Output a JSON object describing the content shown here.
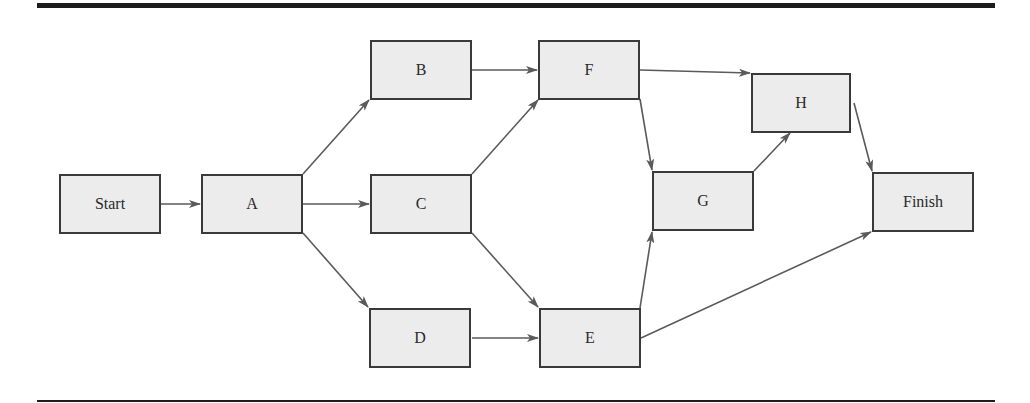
{
  "diagram": {
    "type": "activity-on-node network",
    "colors": {
      "node_fill": "#ececec",
      "node_border": "#3a3a3a",
      "edge": "#5a5a5a",
      "rule": "#1c1c1c"
    },
    "nodes": [
      {
        "id": "start",
        "label": "Start",
        "x": 59,
        "y": 174
      },
      {
        "id": "A",
        "label": "A",
        "x": 201,
        "y": 174
      },
      {
        "id": "B",
        "label": "B",
        "x": 370,
        "y": 40
      },
      {
        "id": "C",
        "label": "C",
        "x": 370,
        "y": 174
      },
      {
        "id": "D",
        "label": "D",
        "x": 369,
        "y": 308
      },
      {
        "id": "F",
        "label": "F",
        "x": 538,
        "y": 40
      },
      {
        "id": "E",
        "label": "E",
        "x": 539,
        "y": 308
      },
      {
        "id": "G",
        "label": "G",
        "x": 652,
        "y": 171
      },
      {
        "id": "H",
        "label": "H",
        "x": 751,
        "y": 73
      },
      {
        "id": "finish",
        "label": "Finish",
        "x": 872,
        "y": 172
      }
    ],
    "edges": [
      [
        "Start",
        "A"
      ],
      [
        "A",
        "B"
      ],
      [
        "A",
        "C"
      ],
      [
        "A",
        "D"
      ],
      [
        "B",
        "F"
      ],
      [
        "C",
        "F"
      ],
      [
        "C",
        "E"
      ],
      [
        "D",
        "E"
      ],
      [
        "F",
        "H"
      ],
      [
        "F",
        "G"
      ],
      [
        "E",
        "G"
      ],
      [
        "E",
        "Finish"
      ],
      [
        "G",
        "H"
      ],
      [
        "H",
        "Finish"
      ]
    ]
  }
}
